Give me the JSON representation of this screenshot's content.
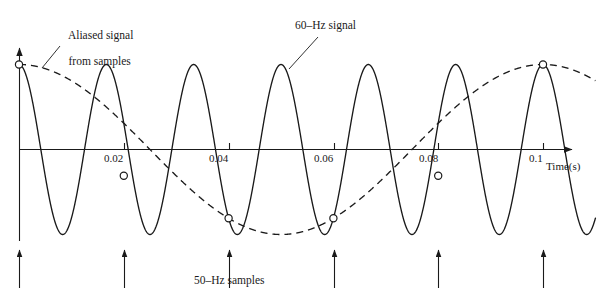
{
  "figure": {
    "background": "#ffffff",
    "ink": "#1a1a1a"
  },
  "annotations": {
    "aliased_label_line1": "Aliased signal",
    "aliased_label_line2": "from samples",
    "signal_label": "60–Hz signal",
    "samples_label": "50–Hz samples"
  },
  "axis": {
    "x_title": "Time(s)",
    "ticks": [
      {
        "label": "0.02",
        "value": 0.02,
        "x": 124
      },
      {
        "label": "0.04",
        "value": 0.04,
        "x": 229
      },
      {
        "label": "0.06",
        "value": 0.06,
        "x": 334
      },
      {
        "label": "0.08",
        "value": 0.08,
        "x": 438
      },
      {
        "label": "0.1",
        "value": 0.1,
        "x": 543
      }
    ],
    "x_range": [
      0,
      0.11
    ],
    "y_range": [
      -1,
      1
    ],
    "grid": false
  },
  "chart_data": {
    "type": "line",
    "title": "",
    "subtitle": "",
    "xlabel": "Time(s)",
    "ylabel": "",
    "xlim": [
      0,
      0.11
    ],
    "ylim": [
      -1.05,
      1.05
    ],
    "grid": false,
    "legend_position": "inline-annotations",
    "xtick_labels": [
      "0.02",
      "0.04",
      "0.06",
      "0.08",
      "0.1"
    ],
    "xtick_values": [
      0.02,
      0.04,
      0.06,
      0.08,
      0.1
    ],
    "series": [
      {
        "name": "60–Hz signal",
        "style": "solid",
        "frequency_hz": 60,
        "amplitude": 1,
        "phase": "cosine",
        "formula": "cos(2*pi*60*t)",
        "color": "#1a1a1a"
      },
      {
        "name": "Aliased signal from samples",
        "style": "dashed",
        "frequency_hz": 10,
        "amplitude": 1,
        "phase": "cosine",
        "formula": "cos(2*pi*10*t)",
        "color": "#1a1a1a"
      }
    ],
    "sample_markers": {
      "name": "50–Hz samples",
      "rate_hz": 50,
      "marker": "open-circle",
      "t": [
        0,
        0.02,
        0.04,
        0.06,
        0.08,
        0.1
      ],
      "y": [
        1,
        -0.309,
        -0.809,
        -0.809,
        -0.309,
        1
      ]
    },
    "sample_arrows": {
      "t": [
        0,
        0.02,
        0.04,
        0.06,
        0.08,
        0.1
      ],
      "x_px": [
        19,
        124,
        229,
        334,
        438,
        543
      ],
      "direction": "up"
    }
  }
}
